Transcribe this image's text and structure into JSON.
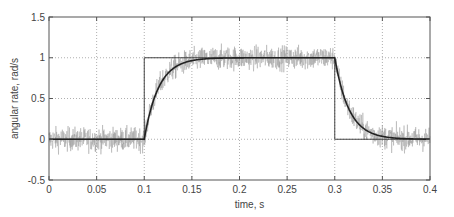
{
  "chart_data": {
    "type": "line",
    "title": "",
    "xlabel": "time, s",
    "ylabel": "angular rate, rad/s",
    "xlim": [
      0,
      0.4
    ],
    "ylim": [
      -0.5,
      1.5
    ],
    "xticks": [
      0,
      0.05,
      0.1,
      0.15,
      0.2,
      0.25,
      0.3,
      0.35,
      0.4
    ],
    "xtick_labels": [
      "0",
      "0.05",
      "0.1",
      "0.15",
      "0.2",
      "0.25",
      "0.3",
      "0.35",
      "0.4"
    ],
    "yticks": [
      -0.5,
      0,
      0.5,
      1,
      1.5
    ],
    "ytick_labels": [
      "-0.5",
      "0",
      "0.5",
      "1",
      "1.5"
    ],
    "grid": true,
    "grid_style": "dotted",
    "legend": null,
    "series": [
      {
        "name": "reference step",
        "style": "thin solid black",
        "color": "#333333",
        "x": [
          0,
          0.1,
          0.1,
          0.3,
          0.3,
          0.4
        ],
        "y": [
          0,
          0,
          1,
          1,
          0,
          0
        ]
      },
      {
        "name": "measured (noisy)",
        "style": "gray noisy signal",
        "color": "#9a9a9a",
        "noise_amplitude": 0.3,
        "description": "noisy measurement around filtered response, band approx ±0.3 rad/s"
      },
      {
        "name": "filtered response",
        "style": "thick solid black",
        "color": "#222222",
        "x": [
          0,
          0.05,
          0.1,
          0.105,
          0.11,
          0.115,
          0.12,
          0.13,
          0.14,
          0.15,
          0.16,
          0.18,
          0.2,
          0.25,
          0.3,
          0.305,
          0.31,
          0.315,
          0.32,
          0.33,
          0.34,
          0.35,
          0.36,
          0.38,
          0.4
        ],
        "y": [
          0,
          0,
          0,
          0.2,
          0.4,
          0.55,
          0.67,
          0.82,
          0.9,
          0.95,
          0.97,
          0.99,
          1.0,
          1.0,
          1.0,
          0.8,
          0.6,
          0.45,
          0.33,
          0.18,
          0.1,
          0.05,
          0.03,
          0.01,
          0.0
        ]
      }
    ],
    "time_constant_s": 0.015,
    "step_on_s": 0.1,
    "step_off_s": 0.3
  }
}
